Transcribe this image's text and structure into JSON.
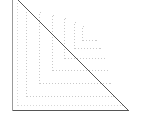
{
  "figure": {
    "type": "geometric-diagram",
    "canvas": {
      "width": 141,
      "height": 130,
      "background": "#ffffff"
    },
    "colors": {
      "background": "#ffffff",
      "hypotenuse": "#555555",
      "outer_border": "#9a9a9a",
      "nested_line": "#c9c9c9",
      "nested_line_faint": "#d8d8d8"
    },
    "triangle": {
      "label": "right-triangle",
      "apex_top": {
        "x": 12,
        "y": -6
      },
      "vertex_bottom_left": {
        "x": 12,
        "y": 110
      },
      "vertex_bottom_right": {
        "x": 128,
        "y": 110
      },
      "leg_vertical_length": 116,
      "leg_horizontal_length": 116,
      "hypotenuse_slope": -1,
      "stroke_width": 1
    },
    "outer_border": {
      "label": "outer-solid-corner",
      "x": 12,
      "y": 110,
      "width": 116,
      "height": 116,
      "stroke": "#9a9a9a",
      "dash": "none"
    },
    "nested_corners": [
      {
        "index": 0,
        "inset": 5,
        "corner_x": 17,
        "corner_y": 105,
        "size": 105,
        "stroke": "#d8d8d8",
        "dash": "1 2"
      },
      {
        "index": 1,
        "inset": 14,
        "corner_x": 26,
        "corner_y": 96,
        "size": 87,
        "stroke": "#c9c9c9",
        "dash": "1 2"
      },
      {
        "index": 2,
        "inset": 27,
        "corner_x": 39,
        "corner_y": 83,
        "size": 71,
        "stroke": "#c9c9c9",
        "dash": "1 2"
      },
      {
        "index": 3,
        "inset": 40,
        "corner_x": 52,
        "corner_y": 70,
        "size": 55,
        "stroke": "#c9c9c9",
        "dash": "1 2"
      },
      {
        "index": 4,
        "inset": 52,
        "corner_x": 64,
        "corner_y": 58,
        "size": 40,
        "stroke": "#c9c9c9",
        "dash": "1 2"
      },
      {
        "index": 5,
        "inset": 62,
        "corner_x": 74,
        "corner_y": 48,
        "size": 26,
        "stroke": "#c9c9c9",
        "dash": "1 2"
      },
      {
        "index": 6,
        "inset": 70,
        "corner_x": 82,
        "corner_y": 40,
        "size": 14,
        "stroke": "#c9c9c9",
        "dash": "1 2"
      }
    ],
    "counts": {
      "nested_corner_count": 7,
      "total_strokes": 9
    }
  }
}
